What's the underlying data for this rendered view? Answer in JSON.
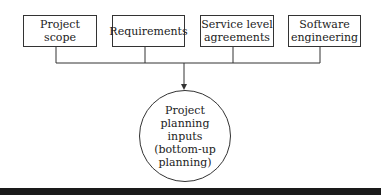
{
  "diagram": {
    "inputs": [
      {
        "label_lines": [
          "Project scope"
        ]
      },
      {
        "label_lines": [
          "Requirements"
        ]
      },
      {
        "label_lines": [
          "Service level",
          "agreements"
        ]
      },
      {
        "label_lines": [
          "Software",
          "engineering"
        ]
      }
    ],
    "target": {
      "label_lines": [
        "Project",
        "planning",
        "inputs",
        "(bottom-up",
        "planning)"
      ]
    },
    "colors": {
      "line": "#333333",
      "bottom_bar": "#1a1a1a"
    }
  }
}
